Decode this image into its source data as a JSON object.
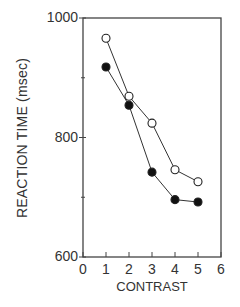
{
  "chart_data": {
    "type": "line",
    "title": "",
    "xlabel": "CONTRAST",
    "ylabel": "REACTION TIME (msec)",
    "xlim": [
      0,
      6
    ],
    "ylim": [
      600,
      1000
    ],
    "x_ticks": [
      "0",
      "1",
      "2",
      "3",
      "4",
      "5",
      "6"
    ],
    "y_ticks": [
      "600",
      "800",
      "1000"
    ],
    "y_minor_ticks": [
      700,
      900
    ],
    "grid": false,
    "legend": null,
    "x": [
      1,
      2,
      3,
      4,
      5
    ],
    "series": [
      {
        "name": "open circles",
        "marker": "open-circle",
        "values": [
          966,
          869,
          824,
          746,
          726
        ]
      },
      {
        "name": "filled circles",
        "marker": "filled-circle",
        "values": [
          918,
          854,
          742,
          696,
          692
        ]
      }
    ]
  },
  "plot": {
    "left": 83,
    "right": 221,
    "top": 18,
    "bottom": 257,
    "line_color": "#333333",
    "marker_fill_open": "#ffffff",
    "marker_fill_filled": "#111111"
  }
}
